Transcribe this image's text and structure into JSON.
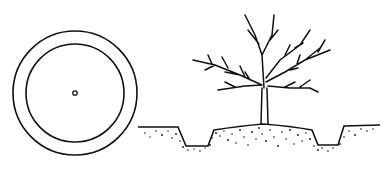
{
  "figure": {
    "colors": {
      "ink": "#111111",
      "background": "#ffffff"
    },
    "top_view": {
      "center": [
        75,
        93
      ],
      "outer_radius": 62,
      "inner_radius": 49,
      "dot_radius": 2
    },
    "side_view": {
      "label": ""
    }
  }
}
